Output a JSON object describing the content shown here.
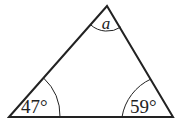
{
  "diagram": {
    "type": "triangle",
    "angles": {
      "top": "a",
      "bottom_left": "47°",
      "bottom_right": "59°"
    },
    "stroke_color": "#222222"
  }
}
